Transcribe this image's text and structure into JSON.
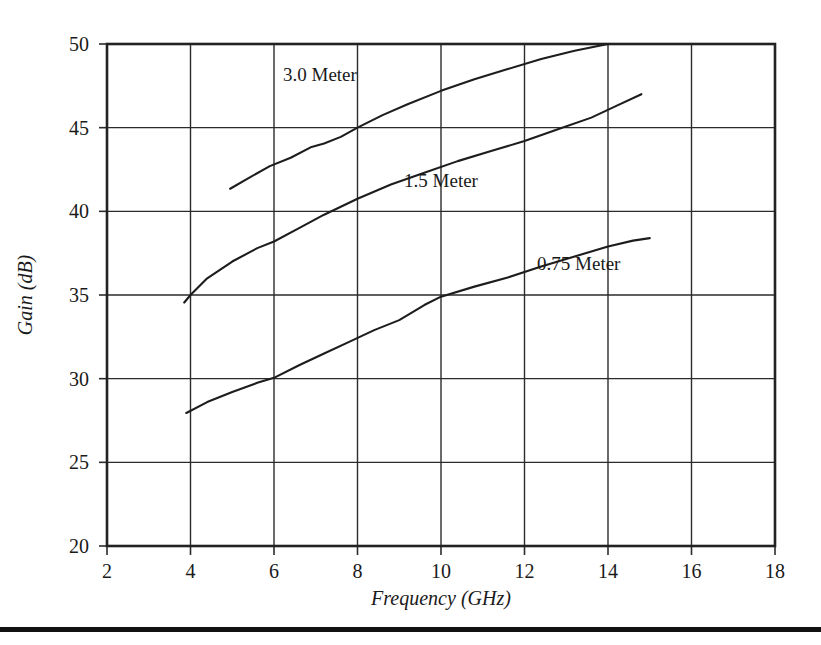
{
  "figure": {
    "name": "antenna-gain-vs-frequency",
    "bottom_rule_color": "#111111"
  },
  "chart_data": {
    "type": "line",
    "title": "",
    "subtitle": "",
    "xlabel": "Frequency (GHz)",
    "xlabel_main": "Frequency",
    "xlabel_unit": "(GHz)",
    "ylabel": "Gain (dB)",
    "ylabel_main": "Gain",
    "ylabel_unit": "(dB)",
    "xlim": [
      2,
      18
    ],
    "ylim": [
      20,
      50
    ],
    "xticks": [
      2,
      4,
      6,
      8,
      10,
      12,
      14,
      16,
      18
    ],
    "yticks": [
      20,
      25,
      30,
      35,
      40,
      45,
      50
    ],
    "xtick_labels": [
      "2",
      "4",
      "6",
      "8",
      "10",
      "12",
      "14",
      "16",
      "18"
    ],
    "ytick_labels": [
      "20",
      "25",
      "30",
      "35",
      "40",
      "45",
      "50"
    ],
    "grid": true,
    "legend_position": "inline-annotations",
    "series": [
      {
        "name": "3.0 Meter",
        "label": "3.0 Meter",
        "label_x": 7.1,
        "label_y": 48.2,
        "x": [
          4.95,
          5.4,
          5.9,
          6.4,
          6.9,
          7.2,
          7.6,
          8.0,
          8.6,
          9.2,
          10.0,
          10.8,
          11.6,
          12.4,
          13.2,
          14.0
        ],
        "y": [
          41.35,
          42.0,
          42.7,
          43.2,
          43.85,
          44.05,
          44.45,
          45.0,
          45.75,
          46.4,
          47.2,
          47.9,
          48.5,
          49.1,
          49.6,
          50.0
        ]
      },
      {
        "name": "1.5 Meter",
        "label": "1.5 Meter",
        "label_x": 10.0,
        "label_y": 41.9,
        "x": [
          3.85,
          4.0,
          4.4,
          5.0,
          5.6,
          6.0,
          6.6,
          7.2,
          8.0,
          8.8,
          9.6,
          10.4,
          11.2,
          12.0,
          12.8,
          13.6,
          14.2,
          14.8
        ],
        "y": [
          34.55,
          35.0,
          36.0,
          37.0,
          37.8,
          38.2,
          39.0,
          39.8,
          40.75,
          41.6,
          42.3,
          43.0,
          43.6,
          44.2,
          44.9,
          45.6,
          46.3,
          47.0
        ]
      },
      {
        "name": "0.75 Meter",
        "label": "0.75 Meter",
        "label_x": 13.3,
        "label_y": 36.9,
        "x": [
          3.9,
          4.4,
          5.0,
          5.6,
          6.0,
          6.6,
          7.2,
          7.8,
          8.4,
          9.0,
          9.6,
          10.0,
          10.8,
          11.6,
          12.4,
          13.2,
          14.0,
          14.6,
          15.0
        ],
        "y": [
          27.95,
          28.6,
          29.2,
          29.75,
          30.05,
          30.8,
          31.5,
          32.2,
          32.9,
          33.5,
          34.4,
          34.9,
          35.5,
          36.05,
          36.7,
          37.3,
          37.9,
          38.25,
          38.4
        ]
      }
    ]
  }
}
